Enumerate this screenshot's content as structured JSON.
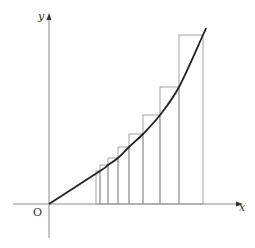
{
  "diagram": {
    "type": "riemann-upper-sum",
    "labels": {
      "x_axis": "x",
      "y_axis": "y",
      "origin": "O"
    },
    "colors": {
      "axis": "#888888",
      "curve": "#222222",
      "rect": "#999999"
    },
    "origin_px": [
      49,
      204
    ],
    "rect_edges_x": [
      96,
      100,
      108,
      118,
      129,
      143,
      160,
      179,
      203
    ],
    "rect_tops_y": [
      171,
      165,
      158,
      147,
      134,
      115,
      87,
      35
    ]
  }
}
